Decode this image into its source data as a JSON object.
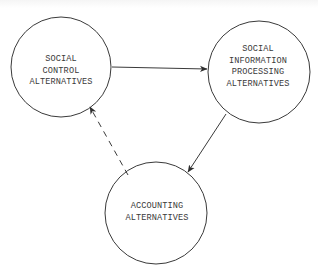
{
  "diagram": {
    "colors": {
      "stroke": "#3a3a3a",
      "text": "#3a3a3a",
      "background": "#ffffff"
    },
    "nodes": [
      {
        "id": "social-control",
        "shape": "circle",
        "cx": 61,
        "cy": 67,
        "r": 50,
        "lines": [
          "SOCIAL",
          "CONTROL",
          "ALTERNATIVES"
        ]
      },
      {
        "id": "social-information-processing",
        "shape": "circle",
        "cx": 259,
        "cy": 72,
        "r": 51,
        "lines": [
          "SOCIAL",
          "INFORMATION",
          "PROCESSING",
          "ALTERNATIVES"
        ]
      },
      {
        "id": "accounting",
        "shape": "circle",
        "cx": 156,
        "cy": 213,
        "r": 51,
        "lines": [
          "ACCOUNTING",
          "ALTERNATIVES"
        ]
      }
    ],
    "edges": [
      {
        "from": "social-control",
        "to": "social-information-processing",
        "style": "solid",
        "x1": 112,
        "y1": 67,
        "x2": 207,
        "y2": 69
      },
      {
        "from": "social-information-processing",
        "to": "accounting",
        "style": "solid",
        "x1": 226,
        "y1": 114,
        "x2": 188,
        "y2": 172
      },
      {
        "from": "accounting",
        "to": "social-control",
        "style": "dashed",
        "x1": 128,
        "y1": 175,
        "x2": 90,
        "y2": 107
      }
    ]
  }
}
